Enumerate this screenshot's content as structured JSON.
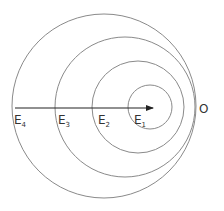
{
  "diagram": {
    "type": "nested eccentric circles with arrow",
    "colors": {
      "circle_stroke": "#8a8a8a",
      "arrow": "#222222",
      "text": "#333333",
      "background": "#ffffff"
    },
    "circles": [
      {
        "id": "E1",
        "cx": 150,
        "cy": 107,
        "r": 22
      },
      {
        "id": "E2",
        "cx": 138,
        "cy": 107,
        "r": 46
      },
      {
        "id": "E3",
        "cx": 125,
        "cy": 107,
        "r": 70
      },
      {
        "id": "E4",
        "cx": 104,
        "cy": 106,
        "r": 92
      }
    ],
    "arrow": {
      "x1": 15,
      "y1": 108,
      "x2": 153,
      "y2": 108
    },
    "labels": [
      {
        "id": "E4",
        "base": "E",
        "sub": "4",
        "x": 14,
        "y": 124
      },
      {
        "id": "E3",
        "base": "E",
        "sub": "3",
        "x": 58,
        "y": 124
      },
      {
        "id": "E2",
        "base": "E",
        "sub": "2",
        "x": 98,
        "y": 124
      },
      {
        "id": "E1",
        "base": "E",
        "sub": "1",
        "x": 134,
        "y": 124
      }
    ],
    "point_label": {
      "text": "O",
      "x": 199,
      "y": 113
    }
  }
}
